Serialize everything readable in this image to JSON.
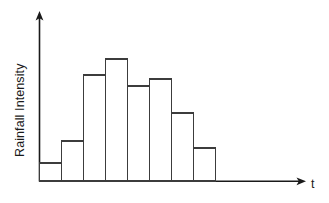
{
  "figure": {
    "name": "rainfall-intensity-hyetograph",
    "background_color": "#ffffff",
    "width": 329,
    "height": 203
  },
  "chart_data": {
    "type": "bar",
    "title": "",
    "xlabel": "t",
    "ylabel": "Rainfall Intensity",
    "categories": [
      "1",
      "2",
      "3",
      "4",
      "5",
      "6",
      "7",
      "8"
    ],
    "values": [
      18,
      40,
      106,
      122,
      95,
      102,
      68,
      33
    ],
    "xlim": [
      0,
      8
    ],
    "ylim": [
      0,
      140
    ],
    "grid": false,
    "legend": null,
    "tick_labels_x": [],
    "tick_labels_y": [],
    "annotations": [],
    "bar_fill_color": "#ffffff",
    "bar_edge_color": "#3c3c3c",
    "axis_color": "#1a1a1a",
    "axis_style": "arrow-terminated open axes, no tick marks"
  },
  "axes": {
    "y_axis": {
      "label": "Rainfall Intensity",
      "arrow": "up-arrow-icon"
    },
    "x_axis": {
      "label": "t",
      "arrow": "right-arrow-icon"
    }
  }
}
